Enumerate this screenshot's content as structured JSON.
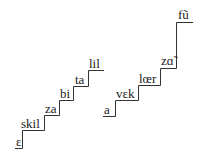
{
  "diagram": {
    "type": "staircase",
    "left_staircase": {
      "steps": [
        {
          "label": "ɛ",
          "x": 16,
          "y": 146
        },
        {
          "label": "skil",
          "x": 21,
          "y": 128
        },
        {
          "label": "za",
          "x": 45,
          "y": 113
        },
        {
          "label": "bi",
          "x": 60,
          "y": 98
        },
        {
          "label": "ta",
          "x": 75,
          "y": 84
        },
        {
          "label": "lil",
          "x": 89,
          "y": 68
        }
      ]
    },
    "right_staircase": {
      "steps": [
        {
          "label": "a",
          "x": 104,
          "y": 114
        },
        {
          "label": "vɛk",
          "x": 116,
          "y": 98
        },
        {
          "label": "lœr",
          "x": 139,
          "y": 83
        },
        {
          "label": "zɑ̃",
          "x": 161,
          "y": 65
        },
        {
          "label": "fũ",
          "x": 178,
          "y": 19
        }
      ]
    },
    "colors": {
      "line": "#333333",
      "text": "#222222",
      "background": "#ffffff"
    }
  }
}
